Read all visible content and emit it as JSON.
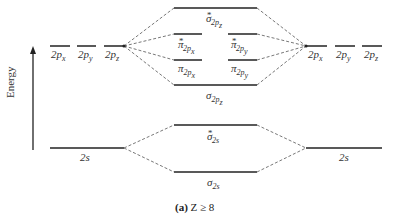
{
  "diagram": {
    "type": "molecular-orbital-energy-diagram",
    "axis_label": "Energy",
    "caption_prefix": "(a)",
    "caption_text": "Z ≥ 8",
    "left_atom": {
      "p_orbitals": [
        "2p_x",
        "2p_y",
        "2p_z"
      ],
      "s_orbital": "2s"
    },
    "right_atom": {
      "p_orbitals": [
        "2p_x",
        "2p_y",
        "2p_z"
      ],
      "s_orbital": "2s"
    },
    "molecular_orbitals": [
      {
        "name": "sigma*_2pz",
        "symbol": "σ",
        "sub": "2p",
        "subsub": "z",
        "star": true
      },
      {
        "name": "pi*_2px",
        "symbol": "π",
        "sub": "2p",
        "subsub": "x",
        "star": true
      },
      {
        "name": "pi*_2py",
        "symbol": "π",
        "sub": "2p",
        "subsub": "y",
        "star": true
      },
      {
        "name": "pi_2px",
        "symbol": "π",
        "sub": "2p",
        "subsub": "x",
        "star": false
      },
      {
        "name": "pi_2py",
        "symbol": "π",
        "sub": "2p",
        "subsub": "y",
        "star": false
      },
      {
        "name": "sigma_2pz",
        "symbol": "σ",
        "sub": "2p",
        "subsub": "z",
        "star": false
      },
      {
        "name": "sigma*_2s",
        "symbol": "σ",
        "sub": "2s",
        "subsub": "",
        "star": true
      },
      {
        "name": "sigma_2s",
        "symbol": "σ",
        "sub": "2s",
        "subsub": "",
        "star": false
      }
    ],
    "labels": {
      "p": "2p",
      "x": "x",
      "y": "y",
      "z": "z",
      "s": "2s",
      "star": "*",
      "sigma": "σ",
      "pi": "π",
      "sub2p": "2p",
      "sub2s": "2s"
    }
  }
}
